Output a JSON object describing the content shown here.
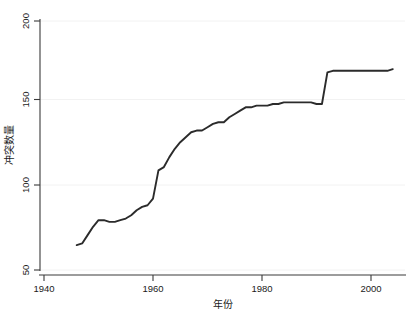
{
  "chart_data": {
    "type": "line",
    "title": "",
    "subtitle": "",
    "xlabel": "年份",
    "ylabel": "冲突数量",
    "xlim": [
      1936,
      2007
    ],
    "ylim": [
      44,
      206
    ],
    "xticks": [
      1940,
      1960,
      1980,
      2000
    ],
    "xtick_labels": [
      "1940",
      "1960",
      "1980",
      "2000"
    ],
    "yticks": [
      50,
      100,
      150,
      200
    ],
    "ytick_labels": [
      "50",
      "100",
      "150",
      "200"
    ],
    "grid": "horizontal-faint",
    "legend": null,
    "legend_position": "none",
    "line_color": "#2b2b2b",
    "background_color": "#ffffff",
    "series": [
      {
        "name": "冲突数量",
        "x": [
          1946,
          1947,
          1948,
          1949,
          1950,
          1951,
          1952,
          1953,
          1954,
          1955,
          1956,
          1957,
          1958,
          1959,
          1960,
          1961,
          1962,
          1963,
          1964,
          1965,
          1966,
          1967,
          1968,
          1969,
          1970,
          1971,
          1972,
          1973,
          1974,
          1975,
          1976,
          1977,
          1978,
          1979,
          1980,
          1981,
          1982,
          1983,
          1984,
          1985,
          1986,
          1987,
          1988,
          1989,
          1990,
          1991,
          1992,
          1993,
          1994,
          1995,
          1996,
          1997,
          1998,
          1999,
          2000,
          2001,
          2002,
          2003,
          2004
        ],
        "values": [
          65,
          66,
          71,
          76,
          80,
          80,
          79,
          79,
          80,
          81,
          83,
          86,
          88,
          89,
          93,
          110,
          112,
          118,
          123,
          127,
          130,
          133,
          134,
          134,
          136,
          138,
          139,
          139,
          142,
          144,
          146,
          148,
          148,
          149,
          149,
          149,
          150,
          150,
          151,
          151,
          151,
          151,
          151,
          151,
          150,
          150,
          169,
          170,
          170,
          170,
          170,
          170,
          170,
          170,
          170,
          170,
          170,
          170,
          171
        ]
      }
    ],
    "annotations": [
      {
        "text": "sharp rise 1960-1961",
        "x": 1961,
        "y": 110
      },
      {
        "text": "sharp rise 1991-1992",
        "x": 1992,
        "y": 169
      }
    ]
  },
  "figure": {
    "x_axis_title": "年份",
    "y_axis_title": "冲突数量"
  }
}
